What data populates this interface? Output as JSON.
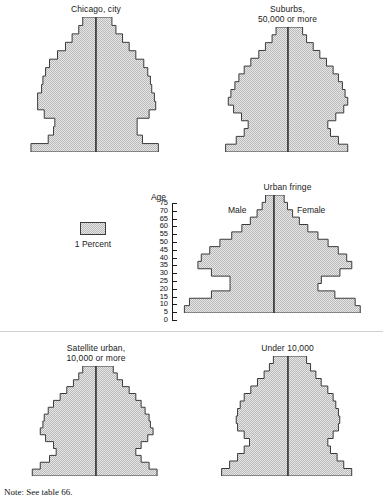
{
  "figure": {
    "note": "Note: See table 66.",
    "legend": {
      "swatch_name": "stipple-swatch",
      "label": "1 Percent"
    },
    "axis": {
      "title": "Age",
      "ticks": [
        "75",
        "70",
        "65",
        "60",
        "55",
        "50",
        "45",
        "40",
        "35",
        "30",
        "25",
        "20",
        "15",
        "10",
        "5",
        "0"
      ],
      "max_age": 80,
      "min_age": 0
    },
    "sex_labels": {
      "left": "Male",
      "right": "Female"
    },
    "colors": {
      "fill": "#d2d2d2",
      "stroke": "#3a3a3a",
      "center_line": "#2a2a2a",
      "divider": "#cfcfcf",
      "text": "#111111"
    }
  },
  "chart_data": {
    "type": "bar",
    "xlabel": "Percent of population",
    "ylabel": "Age",
    "legend_position": "center-left",
    "grid": false,
    "age_groups": [
      "0-5",
      "5-10",
      "10-15",
      "15-20",
      "20-25",
      "25-30",
      "30-35",
      "35-40",
      "40-45",
      "45-50",
      "50-55",
      "55-60",
      "60-65",
      "65-70",
      "70-75",
      "75+"
    ],
    "units": "percent of total population per 5-year age group, each side",
    "panels": [
      {
        "name": "chicago-city",
        "title": "Chicago, city",
        "series": [
          {
            "name": "Male",
            "values": [
              4.9,
              3.6,
              3.2,
              3.1,
              3.9,
              4.4,
              4.4,
              4.1,
              4.0,
              3.8,
              3.5,
              2.9,
              2.3,
              1.8,
              1.3,
              1.0
            ]
          },
          {
            "name": "Female",
            "values": [
              4.7,
              3.5,
              3.1,
              3.1,
              4.0,
              4.5,
              4.4,
              4.2,
              4.1,
              3.9,
              3.6,
              3.0,
              2.5,
              2.0,
              1.5,
              1.2
            ]
          }
        ]
      },
      {
        "name": "suburbs-50000-or-more",
        "title": "Suburbs,\n50,000 or more",
        "series": [
          {
            "name": "Male",
            "values": [
              4.7,
              3.9,
              3.3,
              3.0,
              3.5,
              4.1,
              4.5,
              4.3,
              4.0,
              3.7,
              3.3,
              2.8,
              2.2,
              1.7,
              1.2,
              0.9
            ]
          },
          {
            "name": "Female",
            "values": [
              4.5,
              3.8,
              3.2,
              3.0,
              3.6,
              4.2,
              4.5,
              4.3,
              4.1,
              3.8,
              3.4,
              2.9,
              2.4,
              1.9,
              1.4,
              1.1
            ]
          }
        ]
      },
      {
        "name": "urban-fringe",
        "title": "Urban fringe",
        "series": [
          {
            "name": "Male",
            "values": [
              5.3,
              5.0,
              3.7,
              2.6,
              2.6,
              3.7,
              4.5,
              4.3,
              3.8,
              3.2,
              2.5,
              1.9,
              1.4,
              1.0,
              0.7,
              0.5
            ]
          },
          {
            "name": "Female",
            "values": [
              5.1,
              4.8,
              3.6,
              2.6,
              2.8,
              3.9,
              4.6,
              4.3,
              3.8,
              3.2,
              2.6,
              2.0,
              1.5,
              1.1,
              0.8,
              0.6
            ]
          }
        ]
      },
      {
        "name": "satellite-urban-10000-or-more",
        "title": "Satellite urban,\n10,000 or more",
        "series": [
          {
            "name": "Male",
            "values": [
              4.8,
              4.2,
              3.5,
              3.0,
              3.2,
              3.8,
              4.2,
              4.0,
              3.9,
              3.6,
              3.2,
              2.7,
              2.2,
              1.7,
              1.3,
              1.0
            ]
          },
          {
            "name": "Female",
            "values": [
              4.6,
              4.0,
              3.4,
              3.0,
              3.4,
              3.9,
              4.3,
              4.1,
              4.0,
              3.7,
              3.4,
              3.0,
              2.5,
              2.0,
              1.6,
              1.3
            ]
          }
        ]
      },
      {
        "name": "under-10000",
        "title": "Under 10,000",
        "series": [
          {
            "name": "Male",
            "values": [
              5.0,
              4.4,
              3.8,
              3.3,
              2.9,
              3.3,
              3.8,
              3.9,
              3.8,
              3.6,
              3.3,
              2.8,
              2.3,
              1.8,
              1.4,
              1.1
            ]
          },
          {
            "name": "Female",
            "values": [
              4.8,
              4.2,
              3.7,
              3.2,
              3.0,
              3.4,
              3.8,
              3.9,
              3.8,
              3.6,
              3.4,
              3.0,
              2.5,
              2.1,
              1.7,
              1.4
            ]
          }
        ]
      }
    ]
  }
}
